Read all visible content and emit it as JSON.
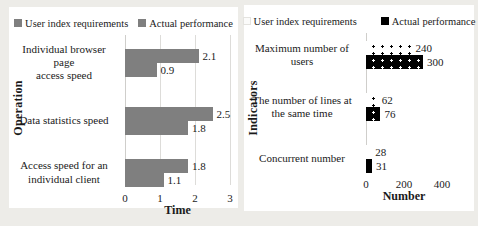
{
  "figure": {
    "background_color": "#edece8",
    "panel_color": "#ffffff",
    "bar_gray": "#7f7f7f"
  },
  "chart_data": [
    {
      "type": "bar",
      "orientation": "horizontal",
      "title": "",
      "ylabel": "Operation",
      "xlabel": "Time",
      "categories": [
        "Individual browser page\naccess speed",
        "Data statistics speed",
        "Access speed for an\nindividual client"
      ],
      "series": [
        {
          "name": "User index requirements",
          "style": "gray",
          "color": "#7f7f7f",
          "pattern": "solid",
          "values": [
            2.1,
            2.5,
            1.8
          ]
        },
        {
          "name": "Actual performance",
          "style": "gray",
          "color": "#7f7f7f",
          "pattern": "solid",
          "values": [
            0.9,
            1.8,
            1.1
          ]
        }
      ],
      "xlim": [
        0,
        3
      ],
      "ticks": [
        0,
        1,
        2,
        3
      ],
      "grid": true,
      "legend_position": "top"
    },
    {
      "type": "bar",
      "orientation": "horizontal",
      "title": "",
      "ylabel": "Indicators",
      "xlabel": "Number",
      "categories": [
        "Maximum number of\nusers",
        "The number of lines at\nthe same time",
        "Concurrent number"
      ],
      "series": [
        {
          "name": "User index requirements",
          "style": "dot-light",
          "color": "#ffffff",
          "pattern": "black-dots-on-white",
          "values": [
            240,
            62,
            28
          ]
        },
        {
          "name": "Actual performance",
          "style": "dot-dark",
          "color": "#000000",
          "pattern": "white-dots-on-black",
          "values": [
            300,
            76,
            31
          ]
        }
      ],
      "xlim": [
        0,
        400
      ],
      "ticks": [
        0,
        200,
        400
      ],
      "grid": false,
      "legend_position": "top"
    }
  ]
}
